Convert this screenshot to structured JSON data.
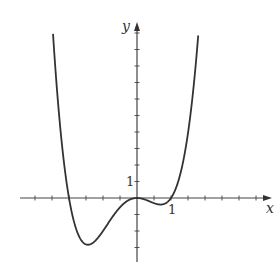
{
  "chart_data": {
    "type": "line",
    "title": "",
    "xlabel": "x",
    "ylabel": "y",
    "function_shape": "quartic with roots at x=-2, x=0 (double), x=1; consistent with y = x^2(x+2)(x-1)",
    "x_tick_label": "1",
    "y_tick_label": "1",
    "x_tick_spacing": 0.5,
    "y_tick_spacing": 1,
    "xlim": [
      -3,
      4
    ],
    "ylim": [
      -3.7,
      10.5
    ],
    "key_points": [
      {
        "x": -2.48,
        "y": 10,
        "note": "curve enters from top-left"
      },
      {
        "x": -2,
        "y": 0,
        "note": "x-intercept"
      },
      {
        "x": -1.4,
        "y": -2.8,
        "note": "global minimum"
      },
      {
        "x": 0,
        "y": 0,
        "note": "local maximum / double root"
      },
      {
        "x": 0.75,
        "y": -0.39,
        "note": "local minimum"
      },
      {
        "x": 1,
        "y": 0,
        "note": "x-intercept"
      },
      {
        "x": 1.8,
        "y": 10,
        "note": "curve exits top-right"
      }
    ],
    "grid": false,
    "legend": null
  },
  "axes": {
    "x_label": "x",
    "y_label": "y",
    "x_unit_label": "1",
    "y_unit_label": "1"
  },
  "colors": {
    "curve": "#333333",
    "axes": "#444444",
    "background": "#ffffff"
  }
}
